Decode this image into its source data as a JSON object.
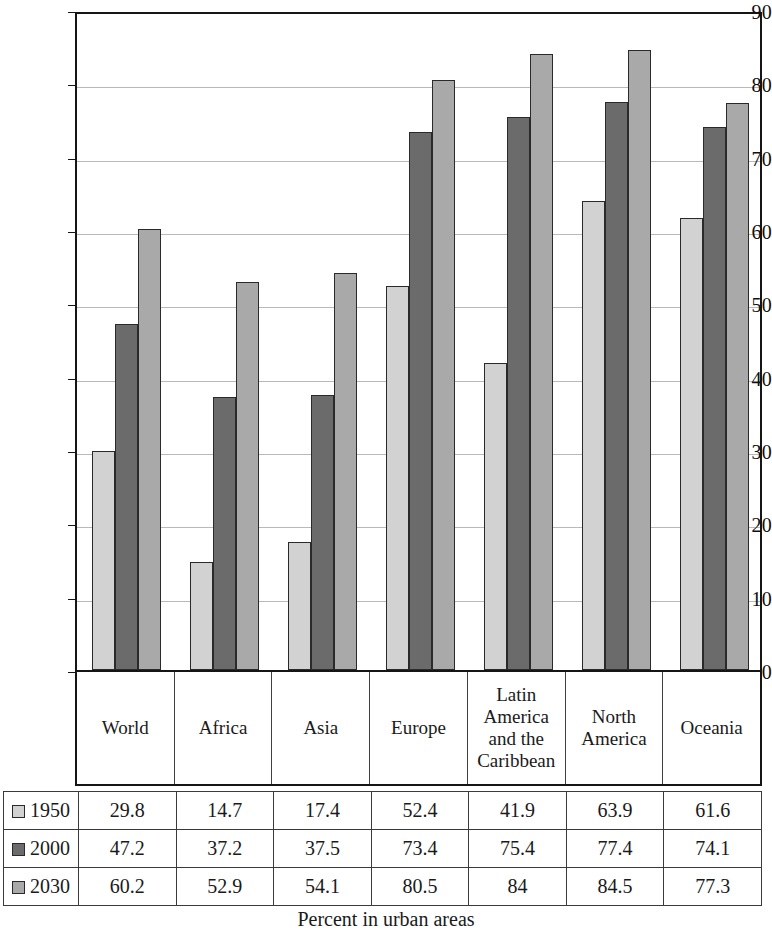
{
  "chart_data": {
    "type": "bar",
    "title": "",
    "xlabel": "Percent in urban areas",
    "ylabel": "",
    "ylim": [
      0,
      90
    ],
    "yticks": [
      0,
      10,
      20,
      30,
      40,
      50,
      60,
      70,
      80,
      90
    ],
    "grid": true,
    "legend_position": "table-row-headers",
    "categories": [
      "World",
      "Africa",
      "Asia",
      "Europe",
      "Latin America and the Caribbean",
      "North America",
      "Oceania"
    ],
    "category_lines": [
      [
        "World"
      ],
      [
        "Africa"
      ],
      [
        "Asia"
      ],
      [
        "Europe"
      ],
      [
        "Latin",
        "America",
        "and the",
        "Caribbean"
      ],
      [
        "North",
        "America"
      ],
      [
        "Oceania"
      ]
    ],
    "series": [
      {
        "name": "1950",
        "color": "#d2d2d2",
        "values": [
          29.8,
          14.7,
          17.4,
          52.4,
          41.9,
          63.9,
          61.6
        ],
        "labels": [
          "29.8",
          "14.7",
          "17.4",
          "52.4",
          "41.9",
          "63.9",
          "61.6"
        ]
      },
      {
        "name": "2000",
        "color": "#6b6b6b",
        "values": [
          47.2,
          37.2,
          37.5,
          73.4,
          75.4,
          77.4,
          74.1
        ],
        "labels": [
          "47.2",
          "37.2",
          "37.5",
          "73.4",
          "75.4",
          "77.4",
          "74.1"
        ]
      },
      {
        "name": "2030",
        "color": "#a9a9a9",
        "values": [
          60.2,
          52.9,
          54.1,
          80.5,
          84,
          84.5,
          77.3
        ],
        "labels": [
          "60.2",
          "52.9",
          "54.1",
          "80.5",
          "84",
          "84.5",
          "77.3"
        ]
      }
    ]
  },
  "caption": {
    "text": "Percent in urban areas"
  }
}
